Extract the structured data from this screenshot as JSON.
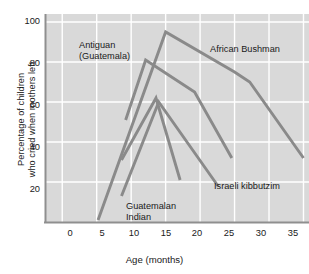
{
  "chart_data": {
    "type": "line",
    "title": "",
    "xlabel": "Age (months)",
    "ylabel": "Percentage of children\nwho cried when mothers left",
    "xlim": [
      -2.5,
      35.8
    ],
    "ylim": [
      0,
      104
    ],
    "xticks": [
      0,
      5,
      10,
      15,
      20,
      25,
      30,
      35
    ],
    "yticks": [
      20,
      40,
      60,
      80,
      100
    ],
    "grid": true,
    "legend_position": "inline-annotations",
    "plot_background": "#d9d9d9",
    "gridline_color": "#ffffff",
    "line_color": "#8a8a8a",
    "series": [
      {
        "name": "African Bushman",
        "label": "African Bushman",
        "label_x": 210,
        "label_y": 44,
        "points": [
          [
            5.2,
            1
          ],
          [
            15.0,
            95
          ],
          [
            25.0,
            75
          ],
          [
            27.2,
            70
          ],
          [
            35.0,
            32
          ]
        ]
      },
      {
        "name": "Antiguan (Guatemala)",
        "label": "Antiguan\n(Guatemala)",
        "label_x": 79,
        "label_y": 40,
        "points": [
          [
            9.2,
            51
          ],
          [
            12.1,
            81
          ],
          [
            19.2,
            65
          ],
          [
            24.6,
            32
          ]
        ]
      },
      {
        "name": "Guatemalan Indian",
        "label": "Guatemalan\nIndian",
        "label_x": 126,
        "label_y": 201,
        "points": [
          [
            8.6,
            31
          ],
          [
            13.6,
            62
          ],
          [
            17.1,
            21
          ]
        ]
      },
      {
        "name": "Israeli kibbutzim",
        "label": "Israeli kibbutzim",
        "label_x": 214,
        "label_y": 181,
        "points": [
          [
            8.6,
            13
          ],
          [
            14.0,
            60
          ],
          [
            22.6,
            18
          ]
        ]
      }
    ]
  },
  "axes": {
    "ytick_labels": [
      "100",
      "80",
      "60",
      "40",
      "20"
    ],
    "xtick_labels": [
      "0",
      "5",
      "10",
      "15",
      "20",
      "25",
      "30",
      "35"
    ],
    "xaxis_title": "Age (months)",
    "yaxis_title": "Percentage of children\nwho cried when mothers left"
  },
  "annotations": {
    "african_bushman": "African Bushman",
    "antiguan": "Antiguan\n(Guatemala)",
    "guatemalan_indian": "Guatemalan\nIndian",
    "israeli_kibbutzim": "Israeli kibbutzim"
  }
}
